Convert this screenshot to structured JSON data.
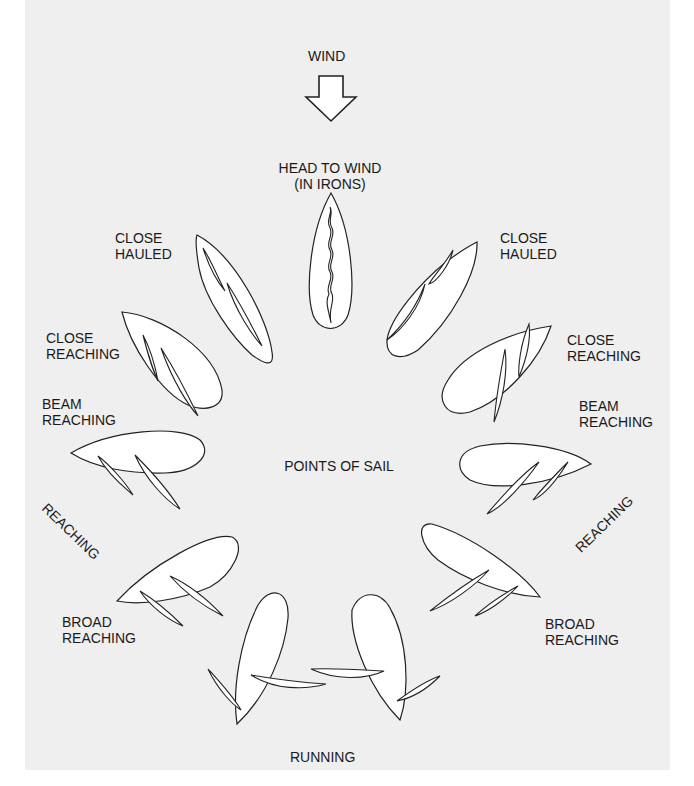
{
  "title": "POINTS OF SAIL",
  "wind": {
    "label": "WIND",
    "icon": "down-arrow-icon"
  },
  "positions": {
    "head_to_wind": {
      "line1": "HEAD TO WIND",
      "line2": "(IN IRONS)"
    },
    "close_hauled_left": {
      "line1": "CLOSE",
      "line2": "HAULED"
    },
    "close_hauled_right": {
      "line1": "CLOSE",
      "line2": "HAULED"
    },
    "close_reaching_left": {
      "line1": "CLOSE",
      "line2": "REACHING"
    },
    "close_reaching_right": {
      "line1": "CLOSE",
      "line2": "REACHING"
    },
    "beam_reaching_left": {
      "line1": "BEAM",
      "line2": "REACHING"
    },
    "beam_reaching_right": {
      "line1": "BEAM",
      "line2": "REACHING"
    },
    "reaching_left": {
      "label": "REACHING"
    },
    "reaching_right": {
      "label": "REACHING"
    },
    "broad_reaching_left": {
      "line1": "BROAD",
      "line2": "REACHING"
    },
    "broad_reaching_right": {
      "line1": "BROAD",
      "line2": "REACHING"
    },
    "running": {
      "label": "RUNNING"
    }
  },
  "colors": {
    "background": "#efefef",
    "stroke": "#222222",
    "fill": "#ffffff",
    "text": "#1a1a1a"
  }
}
